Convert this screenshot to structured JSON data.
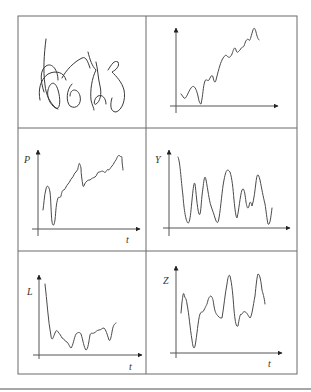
{
  "figure": {
    "layout": "3x2 grid of panels",
    "colors": {
      "lines": "#4a4a4a",
      "grid": "#6a6a6a",
      "background": "#ffffff"
    },
    "panels": [
      {
        "id": "signature",
        "kind": "handwritten-signature",
        "label": ""
      },
      {
        "id": "trend",
        "kind": "time-series",
        "y_label": "",
        "x_label": "",
        "shape": "noisy upward trend"
      },
      {
        "id": "P",
        "kind": "time-series",
        "y_label": "P",
        "x_label": "t",
        "shape": "initial dip then upward trend with drops"
      },
      {
        "id": "Y",
        "kind": "time-series",
        "y_label": "Y",
        "x_label": "t",
        "shape": "oscillating, stationary"
      },
      {
        "id": "L",
        "kind": "time-series",
        "y_label": "L",
        "x_label": "t",
        "shape": "sharp initial decline then low fluctuation"
      },
      {
        "id": "Z",
        "kind": "time-series",
        "y_label": "Z",
        "x_label": "t",
        "shape": "large irregular oscillations"
      }
    ]
  },
  "labels": {
    "p_y": "P",
    "p_x": "t",
    "y_y": "Y",
    "l_y": "L",
    "l_x": "t",
    "z_y": "Z",
    "z_x": "t"
  }
}
